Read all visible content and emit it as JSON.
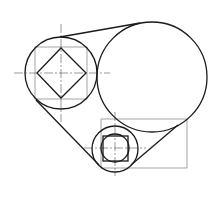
{
  "diagram": {
    "type": "mechanical-linkage-drawing",
    "colors": {
      "outline": "#1a1a1a",
      "construction": "#6a6a6a",
      "background": "#ffffff"
    },
    "left_circle": {
      "cx": 61,
      "cy": 73,
      "r": 36
    },
    "left_square_frame": {
      "x": 35,
      "y": 47,
      "w": 52,
      "h": 52
    },
    "left_diamond": {
      "points": "61,48 86,73 61,98 37,73"
    },
    "large_circle": {
      "cx": 152,
      "cy": 77,
      "r": 55
    },
    "small_circle": {
      "cx": 115,
      "cy": 149,
      "r": 23
    },
    "small_inner_circle": {
      "cx": 115,
      "cy": 148,
      "r": 14
    },
    "small_inner_square": {
      "x": 103,
      "y": 136,
      "w": 25,
      "h": 25
    },
    "small_rect_frame": {
      "x": 101,
      "y": 119,
      "w": 86,
      "h": 49
    },
    "tangent_lines": [
      {
        "x1": 60,
        "y1": 37,
        "x2": 140,
        "y2": 23
      },
      {
        "x1": 36,
        "y1": 100,
        "x2": 99,
        "y2": 165
      },
      {
        "x1": 131,
        "y1": 165,
        "x2": 178,
        "y2": 125
      }
    ],
    "center_lines": [
      {
        "x1": 61,
        "y1": 24,
        "x2": 61,
        "y2": 122
      },
      {
        "x1": 14,
        "y1": 73,
        "x2": 110,
        "y2": 73
      },
      {
        "x1": 115,
        "y1": 112,
        "x2": 115,
        "y2": 176
      },
      {
        "x1": 84,
        "y1": 148,
        "x2": 146,
        "y2": 148
      }
    ]
  }
}
